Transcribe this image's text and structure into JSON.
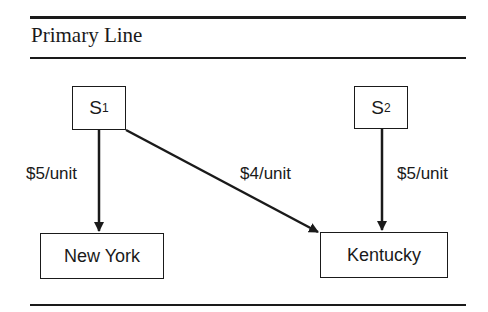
{
  "title": "Primary Line",
  "nodes": {
    "s1": {
      "label": "S",
      "sub": "1"
    },
    "s2": {
      "label": "S",
      "sub": "2"
    },
    "ny": {
      "label": "New York"
    },
    "ky": {
      "label": "Kentucky"
    }
  },
  "edges": [
    {
      "from": "S1",
      "to": "New York",
      "label": "$5/unit"
    },
    {
      "from": "S1",
      "to": "Kentucky",
      "label": "$4/unit"
    },
    {
      "from": "S2",
      "to": "Kentucky",
      "label": "$5/unit"
    }
  ],
  "colors": {
    "ink": "#1a1a1a",
    "background": "#ffffff"
  }
}
